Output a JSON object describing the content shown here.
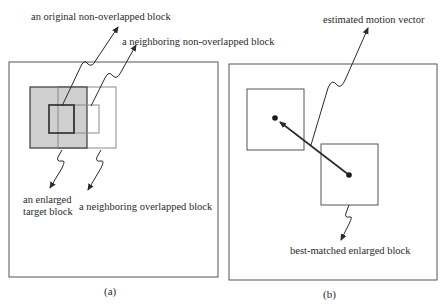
{
  "panels": {
    "a": {
      "caption": "(a)",
      "labels": {
        "original_block": "an original non-overlapped block",
        "neighbor_non_overlapped": "a neighboring non-overlapped block",
        "enlarged_target_line1": "an enlarged",
        "enlarged_target_line2": "target block",
        "neighbor_overlapped": "a neighboring overlapped block"
      }
    },
    "b": {
      "caption": "(b)",
      "labels": {
        "motion_vector": "estimated motion vector",
        "best_matched": "best-matched enlarged block"
      }
    }
  },
  "colors": {
    "line": "#3a3a3a",
    "light_line": "#8a8a8a",
    "enlarged_fill": "#cfcfcf",
    "background": "#ffffff"
  }
}
